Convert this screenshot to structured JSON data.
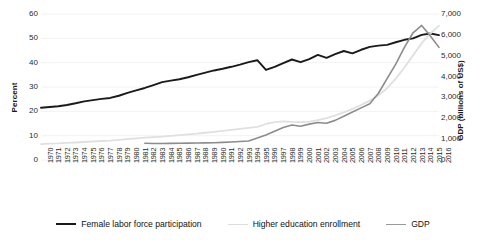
{
  "chart_data": {
    "type": "line",
    "title": "",
    "xlabel": "",
    "ylabel": "Percent",
    "y2label": "GDP (billions of US$)",
    "grid": true,
    "legend_position": "bottom",
    "xlim": [
      1970,
      2016
    ],
    "ylim": [
      0,
      60
    ],
    "y2lim": [
      0,
      7000
    ],
    "ytick_labels": [
      "60",
      "50",
      "40",
      "30",
      "20",
      "10",
      "0"
    ],
    "ytick_values": [
      60,
      50,
      40,
      30,
      20,
      10,
      0
    ],
    "y2tick_labels": [
      "7,000",
      "6,000",
      "5,000",
      "4,000",
      "3,000",
      "2,000",
      "1,000",
      "0"
    ],
    "y2tick_values": [
      7000,
      6000,
      5000,
      4000,
      3000,
      2000,
      1000,
      0
    ],
    "x": [
      1970,
      1971,
      1972,
      1973,
      1974,
      1975,
      1976,
      1977,
      1978,
      1979,
      1980,
      1981,
      1982,
      1983,
      1984,
      1985,
      1986,
      1987,
      1988,
      1989,
      1990,
      1991,
      1992,
      1993,
      1994,
      1995,
      1996,
      1997,
      1998,
      1999,
      2000,
      2001,
      2002,
      2003,
      2004,
      2005,
      2006,
      2007,
      2008,
      2009,
      2010,
      2011,
      2012,
      2013,
      2014,
      2015,
      2016
    ],
    "categories": [
      "1970",
      "1971",
      "1972",
      "1973",
      "1974",
      "1975",
      "1976",
      "1977",
      "1978",
      "1979",
      "1980",
      "1981",
      "1982",
      "1983",
      "1984",
      "1985",
      "1986",
      "1987",
      "1988",
      "1989",
      "1990",
      "1991",
      "1992",
      "1993",
      "1994",
      "1995",
      "1996",
      "1997",
      "1998",
      "1999",
      "2000",
      "2001",
      "2002",
      "2003",
      "2004",
      "2005",
      "2006",
      "2007",
      "2008",
      "2009",
      "2010",
      "2011",
      "2012",
      "2013",
      "2014",
      "2015",
      "2016"
    ],
    "series": [
      {
        "name": "Female labor force participation",
        "axis": "left",
        "color": "#1a1a1a",
        "width": 1.9,
        "values": [
          21.5,
          21.8,
          22.1,
          22.6,
          23.3,
          24.1,
          24.6,
          25.1,
          25.5,
          26.4,
          27.6,
          28.6,
          29.6,
          30.8,
          32.0,
          32.6,
          33.2,
          34.0,
          35.0,
          35.9,
          36.8,
          37.5,
          38.3,
          39.2,
          40.2,
          41.0,
          37.0,
          38.3,
          39.8,
          41.3,
          40.2,
          41.5,
          43.2,
          42.0,
          43.5,
          44.8,
          43.8,
          45.3,
          46.5,
          47.0,
          47.3,
          48.4,
          49.4,
          50.0,
          51.4,
          52.0,
          51.3
        ]
      },
      {
        "name": "Higher education enrollment",
        "axis": "left",
        "color": "#e0e0e0",
        "width": 1.8,
        "values": [
          6.5,
          6.7,
          6.8,
          7.0,
          7.2,
          7.4,
          7.6,
          7.8,
          8.0,
          8.3,
          8.6,
          8.9,
          9.2,
          9.4,
          9.6,
          9.9,
          10.2,
          10.5,
          10.8,
          11.2,
          11.6,
          12.0,
          12.4,
          12.8,
          13.2,
          13.6,
          14.8,
          15.6,
          15.9,
          15.7,
          15.6,
          15.8,
          16.4,
          17.2,
          18.3,
          19.6,
          21.0,
          22.6,
          24.4,
          26.6,
          29.5,
          33.4,
          38.0,
          43.0,
          48.0,
          52.0,
          55.2
        ]
      },
      {
        "name": "GDP",
        "axis": "right",
        "color": "#8c8c8c",
        "width": 1.6,
        "values": [
          null,
          null,
          null,
          null,
          null,
          null,
          null,
          null,
          null,
          null,
          null,
          null,
          800,
          790,
          790,
          795,
          800,
          810,
          815,
          820,
          830,
          845,
          865,
          885,
          910,
          1050,
          1200,
          1380,
          1560,
          1680,
          1620,
          1720,
          1800,
          1760,
          1900,
          2100,
          2300,
          2500,
          2700,
          3200,
          3900,
          4600,
          5400,
          6100,
          6450,
          5950,
          5400
        ]
      }
    ]
  },
  "axes": {
    "left_title": "Percent",
    "right_title": "GDP (billions of US$)"
  },
  "legend": {
    "items": [
      {
        "label": "Female labor force participation",
        "color": "#1a1a1a"
      },
      {
        "label": "Higher education enrollment",
        "color": "#dcdcdc"
      },
      {
        "label": "GDP",
        "color": "#9a9a9a"
      }
    ]
  },
  "colors": {
    "female_lfp": "#1a1a1a",
    "higher_ed": "#dcdcdc",
    "gdp": "#8c8c8c",
    "grid": "#f2f2f2",
    "text": "#2b2b2b"
  }
}
